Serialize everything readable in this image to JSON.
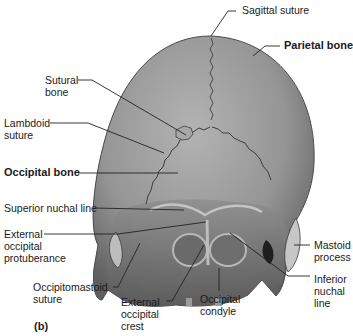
{
  "figure_letter": "(b)",
  "colors": {
    "bone_light": "#a9a9a9",
    "bone_mid": "#8c8c8c",
    "bone_dark": "#5a5a5a",
    "shadow": "#2a2a2a",
    "leader_line": "#222222",
    "suture": "#4a4a4a"
  },
  "labels": {
    "sagittal_suture": "Sagittal suture",
    "parietal_bone": "Parietal bone",
    "sutural_bone": "Sutural\nbone",
    "lambdoid_suture": "Lambdoid\nsuture",
    "occipital_bone": "Occipital bone",
    "superior_nuchal_line": "Superior nuchal line",
    "external_occipital_protuberance": "External\noccipital\nprotuberance",
    "mastoid_process": "Mastoid\nprocess",
    "occipitomastoid_suture": "Occipitomastoid\nsuture",
    "inferior_nuchal_line": "Inferior\nnuchal\nline",
    "external_occipital_crest": "External\noccipital\ncrest",
    "occipital_condyle": "Occipital\ncondyle"
  }
}
